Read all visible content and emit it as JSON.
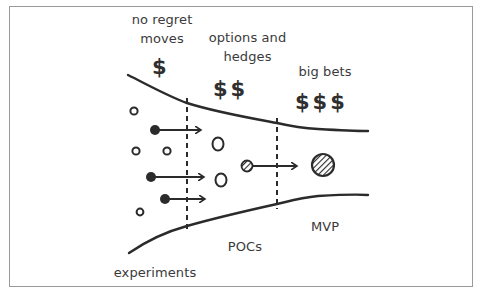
{
  "diagram": {
    "title": "",
    "stages": [
      {
        "id": "no-regret",
        "label_line1": "no regret",
        "label_line2": "moves",
        "cost": "$"
      },
      {
        "id": "options",
        "label_line1": "options and",
        "label_line2": "hedges",
        "cost": "$$"
      },
      {
        "id": "big-bets",
        "label_line1": "big bets",
        "label_line2": "",
        "cost": "$$$"
      }
    ],
    "bottom_labels": {
      "experiments": "experiments",
      "pocs": "POCs",
      "mvp": "MVP"
    },
    "colors": {
      "stroke": "#2b2b2b",
      "frame": "#9a9a9a",
      "text": "#3a3a3a"
    }
  }
}
